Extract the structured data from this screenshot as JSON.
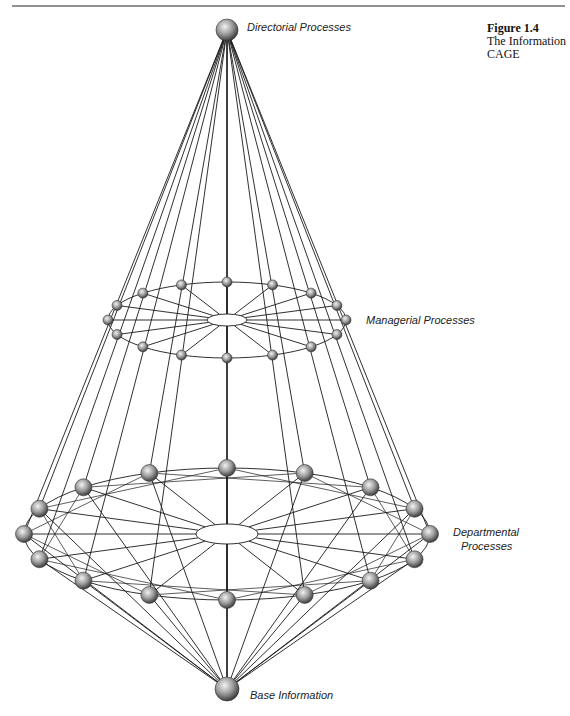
{
  "figure": {
    "number": "Figure 1.4",
    "caption": "The Information CAGE"
  },
  "labels": {
    "top": "Directorial Processes",
    "middle": "Managerial Processes",
    "lower_line1": "Departmental",
    "lower_line2": "Processes",
    "base": "Base Information"
  },
  "colors": {
    "line": "#1a1a1a",
    "node_light": "#e6e6e6",
    "node_dark": "#4a4a4a"
  },
  "diagram": {
    "top_node": {
      "x": 227,
      "y": 30,
      "r": 11
    },
    "base_node": {
      "x": 227,
      "y": 689,
      "r": 12
    },
    "managerial_ring": {
      "cx": 227,
      "cy": 320,
      "rx": 119,
      "ry": 38,
      "hub_rx": 20,
      "hub_ry": 6,
      "node_r": 5,
      "node_count": 16
    },
    "departmental_ring": {
      "cx": 227,
      "cy": 534,
      "rx": 203,
      "ry": 66,
      "hub_rx": 31,
      "hub_ry": 10,
      "node_r": 8.5,
      "node_count": 16
    }
  }
}
